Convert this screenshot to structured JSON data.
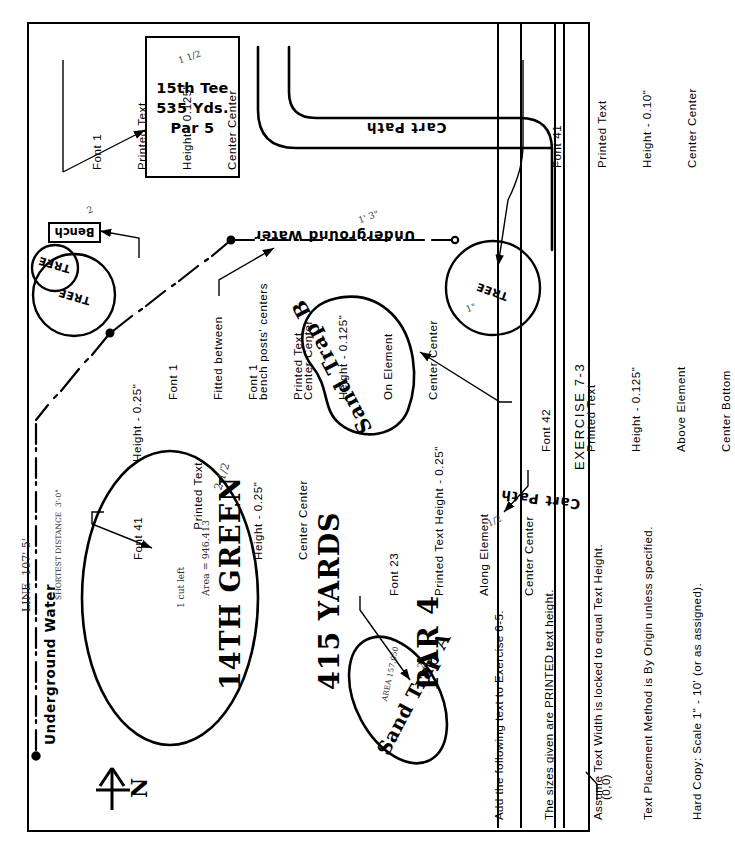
{
  "sheet": {
    "exercise_label": "EXERCISE 7-3",
    "origin_label": "(0,0)"
  },
  "instructions": {
    "lines": [
      "Add the following text to Exercise 6-5.",
      "The sizes given are PRINTED text height.",
      "Assume Text Width is locked to equal Text Height.",
      "Text Placement Method is By Origin unless specified.",
      "Hard Copy: Scale 1\" - 10' (or as assigned)."
    ]
  },
  "callouts": {
    "tee": {
      "font": "Font 1",
      "kind": "Printed Text",
      "height": "Height - 0.125\"",
      "justify": "Center Center"
    },
    "cart_path_top": {
      "font": "Font 41",
      "kind": "Printed Text",
      "height": "Height - 0.10\"",
      "justify": "Center Center"
    },
    "bench": {
      "font": "Font 1",
      "fit": "Fitted between",
      "fit2": "bench posts' centers",
      "justify": "Center Center",
      "height": "Height - 0.25\""
    },
    "underground_water": {
      "font": "Font 1",
      "kind": "Printed Text",
      "height": "Height - 0.125\"",
      "placement": "On Element",
      "justify": "Center Center"
    },
    "green": {
      "font": "Font 41",
      "kind": "Printed Text",
      "height": "Height - 0.25\"",
      "justify": "Center Center"
    },
    "sand_trap_b": {
      "font": "Font 42",
      "kind": "Printed Text",
      "height": "Height - 0.125\"",
      "placement": "Above Element",
      "justify": "Center Bottom"
    },
    "sand_trap_a": {
      "font": "Font 23",
      "height": "Printed Text Height - 0.25\"",
      "placement": "Along Element",
      "justify": "Center Center"
    }
  },
  "map": {
    "tee_text": [
      "15th Tee",
      "535 Yds.",
      "Par 5"
    ],
    "cart_path_top_label": "Cart Path",
    "cart_path_bottom_label": "Cart Path",
    "underground_water_mid": "Underground Water",
    "underground_water_left": "Underground Water",
    "bench_label": "Bench",
    "tree_left_1": "TREE",
    "tree_left_2": "TREE",
    "tree_right": "TREE",
    "sand_trap_b": "Sand Trap B",
    "sand_trap_a": "Sand Trap A",
    "green_lines": [
      "14TH GREEN",
      "415 YARDS",
      "PAR 4"
    ],
    "north_letter": "N"
  },
  "handwritten": {
    "water_line_note": "LINE  107' 5'",
    "water_sub_note": "SHORTEST DISTANCE  3'-0\"",
    "tee_note": "1 1/2",
    "bench_note": "2",
    "water_note": "1' 3\"",
    "green_note": "2 1/2",
    "green_calc_1": "1 cut left",
    "green_calc_2": "Area = 946.413",
    "trap_a_note": "2",
    "trap_a_area": "AREA 157,050",
    "tree_right_note": "1\"",
    "cart_path_note": "1/2"
  },
  "colors": {
    "ink": "#000000",
    "paper": "#ffffff"
  }
}
